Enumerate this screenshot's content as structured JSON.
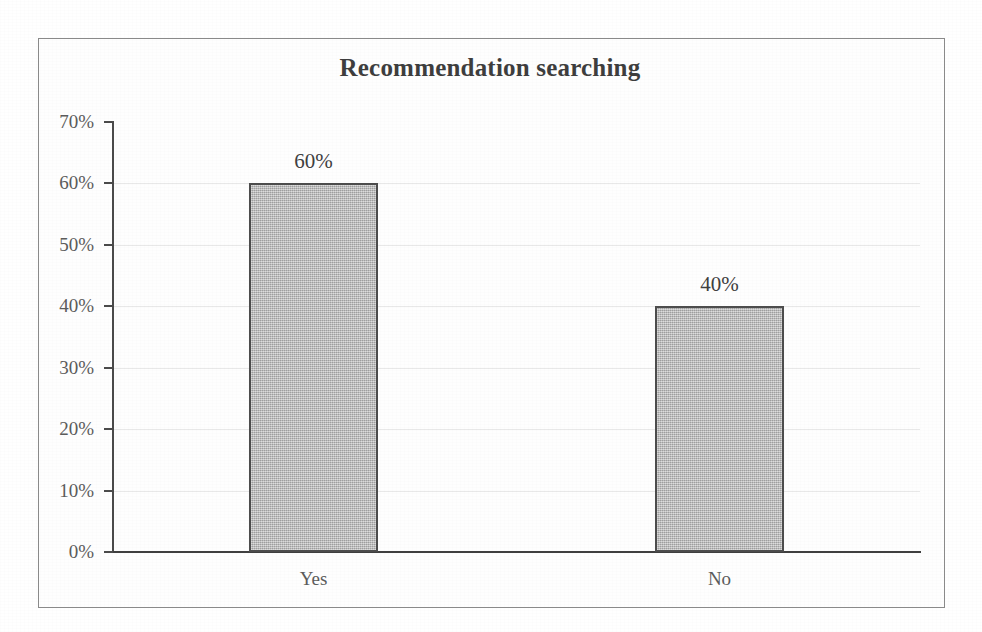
{
  "chart_data": {
    "type": "bar",
    "title": "Recommendation searching",
    "categories": [
      "Yes",
      "No"
    ],
    "values": [
      60,
      40
    ],
    "value_labels": [
      "60%",
      "40%"
    ],
    "xlabel": "",
    "ylabel": "",
    "ylim": [
      0,
      70
    ],
    "ytick_labels": [
      "70%",
      "60%",
      "50%",
      "40%",
      "30%",
      "20%",
      "10%",
      "0%"
    ],
    "ytick_values": [
      70,
      60,
      50,
      40,
      30,
      20,
      10,
      0
    ],
    "ytick_step": 10,
    "unit": "%",
    "grid": true,
    "legend": "none",
    "series": [
      {
        "name": "Recommendation searching",
        "values": [
          60,
          40
        ]
      }
    ],
    "bar_fill_color": "#bdbdbd",
    "bar_border_color": "#4c4c4c",
    "axis_color": "#4a4a4a",
    "text_color": "#5b5b5b",
    "title_color": "#3d3d3d",
    "frame_color": "#8a8a8a"
  }
}
